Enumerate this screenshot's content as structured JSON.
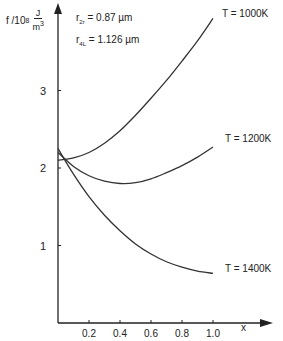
{
  "chart_data": {
    "type": "line",
    "title": "",
    "xlabel": "x",
    "ylabel": "f / 10^8 J/m^3",
    "ylabel_parts": {
      "symbol": "f /10",
      "exp": "8",
      "num": "J",
      "den": "m",
      "den_exp": "3"
    },
    "xlim": [
      0,
      1.1
    ],
    "ylim": [
      0,
      4
    ],
    "x_ticks": [
      0.2,
      0.4,
      0.6,
      0.8,
      1.0
    ],
    "x_tick_labels": [
      "0.2",
      "0.4",
      "0.6",
      "0.8",
      "1.0"
    ],
    "y_ticks": [
      1,
      2,
      3
    ],
    "y_tick_labels": [
      "1",
      "2",
      "3"
    ],
    "grid": false,
    "annotations": [
      {
        "text_main": "r",
        "text_sub": "2r",
        "text_rest": " = 0.87 µm"
      },
      {
        "text_main": "r",
        "text_sub": "4L",
        "text_rest": " = 1.126 µm"
      }
    ],
    "series": [
      {
        "name": "T = 1000K",
        "x": [
          0,
          0.1,
          0.2,
          0.3,
          0.4,
          0.5,
          0.6,
          0.7,
          0.8,
          0.9,
          1.0
        ],
        "values": [
          2.1,
          2.13,
          2.2,
          2.32,
          2.48,
          2.68,
          2.9,
          3.13,
          3.38,
          3.64,
          3.93
        ]
      },
      {
        "name": "T = 1200K",
        "x": [
          0,
          0.1,
          0.2,
          0.3,
          0.4,
          0.5,
          0.6,
          0.7,
          0.8,
          0.9,
          1.0
        ],
        "values": [
          2.2,
          2.02,
          1.9,
          1.83,
          1.8,
          1.81,
          1.86,
          1.94,
          2.03,
          2.14,
          2.27
        ]
      },
      {
        "name": "T = 1400K",
        "x": [
          0,
          0.1,
          0.2,
          0.3,
          0.4,
          0.5,
          0.6,
          0.7,
          0.8,
          0.9,
          1.0
        ],
        "values": [
          2.25,
          1.92,
          1.63,
          1.39,
          1.19,
          1.02,
          0.89,
          0.79,
          0.72,
          0.67,
          0.64
        ]
      }
    ]
  }
}
